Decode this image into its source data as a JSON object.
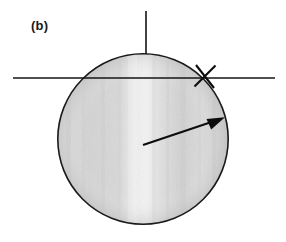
{
  "figure": {
    "panel_label": "(b)",
    "width": 286,
    "height": 242,
    "background_color": "#ffffff",
    "ink_color": "#111111",
    "disk": {
      "name": "shaded-disk",
      "center_x": 143,
      "center_y": 139,
      "radius": 86,
      "outline_color": "#1a1a1a",
      "outline_width": 1.6,
      "fill_light": "#e8e8e8",
      "fill_mid": "#d2d2d2",
      "fill_dark": "#c6c6c6",
      "highlight_x": 132,
      "highlight_color": "#f2f2f2"
    },
    "vertical_axis": {
      "name": "vertical-axis-line",
      "x": 146,
      "y_top": 11,
      "y_bottom": 54,
      "color": "#141414",
      "width": 1.5
    },
    "horizontal_axis": {
      "name": "horizontal-axis-line",
      "y": 78,
      "x_left": 13,
      "x_right": 275,
      "color": "#141414",
      "width": 1.5
    },
    "cross_mark": {
      "name": "x-cross-mark",
      "center_x": 205,
      "center_y": 76,
      "arm_length": 13,
      "color": "#0d0d0d",
      "width": 2.0,
      "angle_a": 38,
      "angle_b": -42
    },
    "arrow": {
      "name": "radius-arrow",
      "tail_x": 143,
      "tail_y": 145,
      "head_x": 224,
      "head_y": 118,
      "color": "#0d0d0d",
      "shaft_width": 2.0,
      "head_length": 17,
      "head_half_width": 5
    }
  }
}
